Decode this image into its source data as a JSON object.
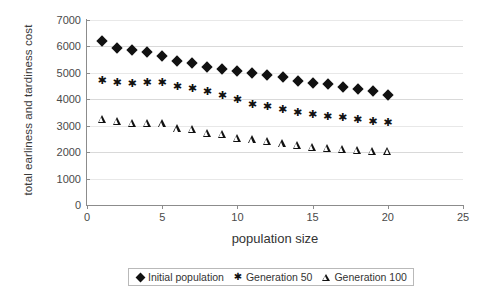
{
  "chart_data": {
    "type": "scatter",
    "title": "",
    "xlabel": "population size",
    "ylabel": "total earliness and tardiness cost",
    "xlim": [
      0,
      25
    ],
    "ylim": [
      0,
      7000
    ],
    "xticks": [
      0,
      5,
      10,
      15,
      20,
      25
    ],
    "yticks": [
      0,
      1000,
      2000,
      3000,
      4000,
      5000,
      6000,
      7000
    ],
    "grid": true,
    "legend_position": "bottom",
    "x": [
      1,
      2,
      3,
      4,
      5,
      6,
      7,
      8,
      9,
      10,
      11,
      12,
      13,
      14,
      15,
      16,
      17,
      18,
      19,
      20
    ],
    "series": [
      {
        "name": "Initial population",
        "marker": "diamond",
        "color": "#111111",
        "values": [
          6200,
          5930,
          5870,
          5780,
          5640,
          5440,
          5370,
          5230,
          5160,
          5060,
          4980,
          4910,
          4840,
          4700,
          4610,
          4560,
          4480,
          4400,
          4320,
          4170
        ]
      },
      {
        "name": "Generation 50",
        "marker": "star",
        "color": "#111111",
        "values": [
          4700,
          4630,
          4560,
          4620,
          4600,
          4480,
          4380,
          4280,
          4120,
          3980,
          3790,
          3700,
          3600,
          3490,
          3420,
          3340,
          3280,
          3200,
          3140,
          3100
        ]
      },
      {
        "name": "Generation 100",
        "marker": "triangle",
        "color": "#111111",
        "values": [
          3250,
          3180,
          3110,
          3110,
          3090,
          2900,
          2870,
          2740,
          2700,
          2540,
          2480,
          2420,
          2330,
          2270,
          2200,
          2160,
          2120,
          2080,
          2060,
          2040
        ]
      }
    ]
  },
  "legend": {
    "items": [
      {
        "label": "Initial population",
        "marker": "diamond-marker-icon"
      },
      {
        "label": "Generation 50",
        "marker": "star-marker-icon"
      },
      {
        "label": "Generation 100",
        "marker": "triangle-marker-icon"
      }
    ]
  }
}
